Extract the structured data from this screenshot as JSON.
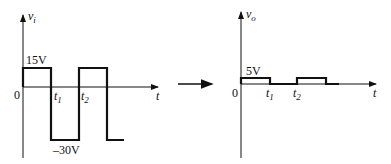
{
  "input_graph": {
    "y_label": "v",
    "y_label_sub": "i",
    "x_label": "t",
    "origin": "0",
    "high_level": "15V",
    "low_level": "–30V",
    "t1": "t",
    "t1_sub": "1",
    "t2": "t",
    "t2_sub": "2"
  },
  "output_graph": {
    "y_label": "v",
    "y_label_sub": "o",
    "x_label": "t",
    "origin": "0",
    "high_level": "5V",
    "t1": "t",
    "t1_sub": "1",
    "t2": "t",
    "t2_sub": "2"
  }
}
